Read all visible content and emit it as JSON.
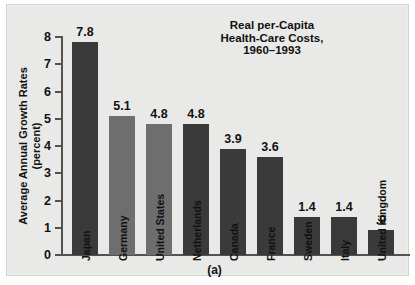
{
  "figure": {
    "caption": "(a)",
    "background_color": "#e9e9e7",
    "bar_color": "#3a3a3a",
    "bar_color_light": "#6e6e6e",
    "axis_color": "#54524f"
  },
  "title": {
    "line1": "Real per-Capita",
    "line2": "Health-Care Costs,",
    "line3": "1960–1993"
  },
  "yaxis": {
    "label_line1": "Average Annual Growth Rates",
    "label_line2": "(percent)",
    "ticks": [
      "8",
      "7",
      "6",
      "5",
      "4",
      "3",
      "2",
      "1",
      "0"
    ]
  },
  "chart_data": {
    "type": "bar",
    "title": "Real per-Capita Health-Care Costs, 1960–1993",
    "xlabel": "",
    "ylabel": "Average Annual Growth Rates (percent)",
    "ylim": [
      0,
      8
    ],
    "yticks": [
      0,
      1,
      2,
      3,
      4,
      5,
      6,
      7,
      8
    ],
    "grid": false,
    "legend": "none",
    "categories": [
      "Japan",
      "Germany",
      "United States",
      "Netherlands",
      "Canada",
      "France",
      "Sweden",
      "Italy",
      "United Kingdom"
    ],
    "values": [
      7.8,
      5.1,
      4.8,
      4.8,
      3.9,
      3.6,
      1.4,
      1.4,
      0.9
    ],
    "value_labels": [
      "7.8",
      "5.1",
      "4.8",
      "4.8",
      "3.9",
      "3.6",
      "1.4",
      "1.4",
      ".9"
    ],
    "bar_shades": [
      "dark",
      "light",
      "light",
      "dark",
      "dark",
      "dark",
      "dark",
      "dark",
      "dark"
    ]
  },
  "bars": [
    {
      "label": "Japan",
      "value": 7.8,
      "value_label": "7.8",
      "x": 65,
      "shade": "dark"
    },
    {
      "label": "Germany",
      "value": 5.1,
      "value_label": "5.1",
      "x": 102,
      "shade": "light"
    },
    {
      "label": "United States",
      "value": 4.8,
      "value_label": "4.8",
      "x": 139,
      "shade": "light"
    },
    {
      "label": "Netherlands",
      "value": 4.8,
      "value_label": "4.8",
      "x": 176,
      "shade": "dark"
    },
    {
      "label": "Canada",
      "value": 3.9,
      "value_label": "3.9",
      "x": 213,
      "shade": "dark"
    },
    {
      "label": "France",
      "value": 3.6,
      "value_label": "3.6",
      "x": 250,
      "shade": "dark"
    },
    {
      "label": "Sweden",
      "value": 1.4,
      "value_label": "1.4",
      "x": 287,
      "shade": "dark"
    },
    {
      "label": "Italy",
      "value": 1.4,
      "value_label": "1.4",
      "x": 324,
      "shade": "dark"
    },
    {
      "label": "United Kingdom",
      "value": 0.9,
      "value_label": ".9",
      "x": 361,
      "shade": "dark"
    }
  ]
}
